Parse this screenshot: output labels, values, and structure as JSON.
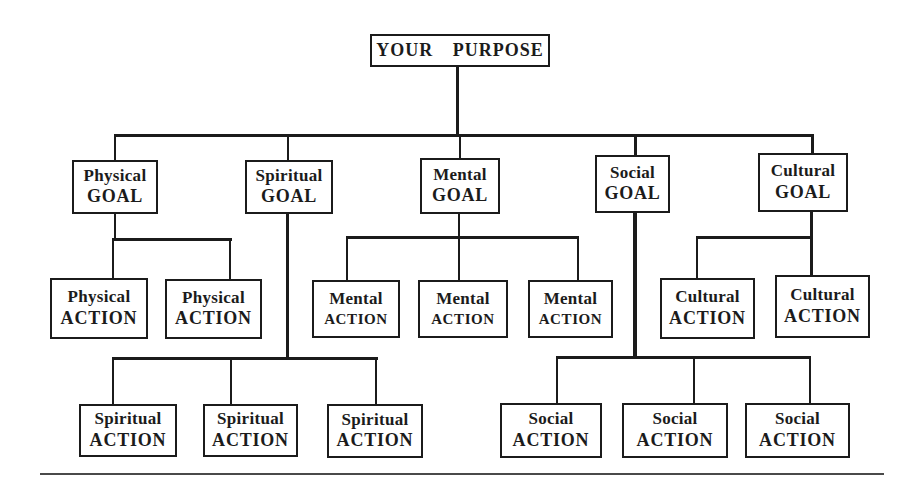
{
  "diagram": {
    "root_label": "YOUR PURPOSE",
    "goals": [
      {
        "name": "Physical",
        "type": "GOAL"
      },
      {
        "name": "Spiritual",
        "type": "GOAL"
      },
      {
        "name": "Mental",
        "type": "GOAL"
      },
      {
        "name": "Social",
        "type": "GOAL"
      },
      {
        "name": "Cultural",
        "type": "GOAL"
      }
    ],
    "actions": {
      "physical": [
        {
          "name": "Physical",
          "type": "ACTION"
        },
        {
          "name": "Physical",
          "type": "ACTION"
        }
      ],
      "mental": [
        {
          "name": "Mental",
          "type": "ACTION"
        },
        {
          "name": "Mental",
          "type": "ACTION"
        },
        {
          "name": "Mental",
          "type": "ACTION"
        }
      ],
      "cultural": [
        {
          "name": "Cultural",
          "type": "ACTION"
        },
        {
          "name": "Cultural",
          "type": "ACTION"
        }
      ],
      "spiritual": [
        {
          "name": "Spiritual",
          "type": "ACTION"
        },
        {
          "name": "Spiritual",
          "type": "ACTION"
        },
        {
          "name": "Spiritual",
          "type": "ACTION"
        }
      ],
      "social": [
        {
          "name": "Social",
          "type": "ACTION"
        },
        {
          "name": "Social",
          "type": "ACTION"
        },
        {
          "name": "Social",
          "type": "ACTION"
        }
      ]
    },
    "colors": {
      "ink": "#1b1b1b",
      "background": "#ffffff"
    }
  }
}
